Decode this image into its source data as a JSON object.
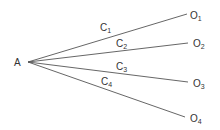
{
  "diagram": {
    "source": {
      "label": "A",
      "x": 14,
      "y": 66
    },
    "apex": {
      "x": 28,
      "y": 62
    },
    "line_color": "#555555",
    "branches": [
      {
        "edge_label": "C",
        "edge_sub": "1",
        "target_label": "O",
        "target_sub": "1",
        "end": {
          "x": 187,
          "y": 14
        },
        "edge_pos": {
          "x": 100,
          "y": 31
        },
        "target_pos": {
          "x": 190,
          "y": 19
        }
      },
      {
        "edge_label": "C",
        "edge_sub": "2",
        "target_label": "O",
        "target_sub": "2",
        "end": {
          "x": 188,
          "y": 43
        },
        "edge_pos": {
          "x": 116,
          "y": 47
        },
        "target_pos": {
          "x": 193,
          "y": 47
        }
      },
      {
        "edge_label": "C",
        "edge_sub": "3",
        "target_label": "O",
        "target_sub": "3",
        "end": {
          "x": 188,
          "y": 82
        },
        "edge_pos": {
          "x": 116,
          "y": 70
        },
        "target_pos": {
          "x": 193,
          "y": 87
        }
      },
      {
        "edge_label": "C",
        "edge_sub": "4",
        "target_label": "O",
        "target_sub": "4",
        "end": {
          "x": 185,
          "y": 117
        },
        "edge_pos": {
          "x": 101,
          "y": 85
        },
        "target_pos": {
          "x": 190,
          "y": 122
        }
      }
    ]
  }
}
